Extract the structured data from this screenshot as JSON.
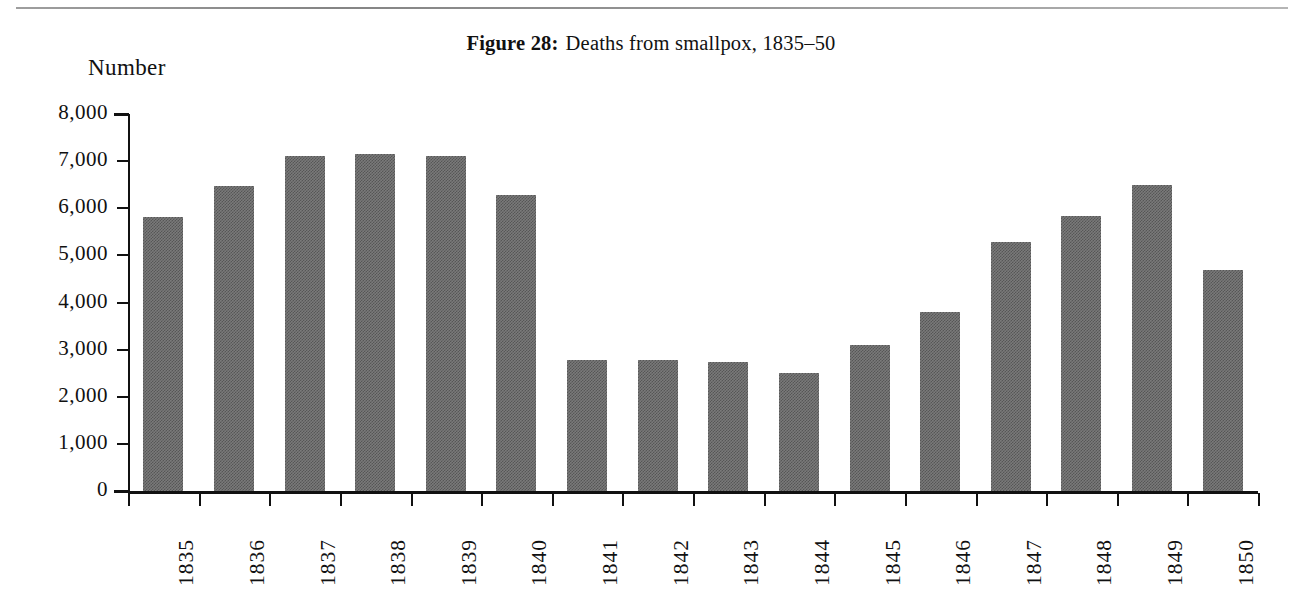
{
  "page": {
    "rule_present": true
  },
  "title": {
    "figure_label": "Figure 28:",
    "caption": "Deaths from smallpox, 1835–50"
  },
  "axes": {
    "y_axis_title": "Number",
    "y_tick_labels": [
      "8,000",
      "7,000",
      "6,000",
      "5,000",
      "4,000",
      "3,000",
      "2,000",
      "1,000",
      "0"
    ]
  },
  "colors": {
    "bar_fill": "#7a7a7a",
    "bar_dither": "#565656",
    "axis": "#111111",
    "background": "#ffffff"
  },
  "chart_data": {
    "type": "bar",
    "xlabel": "",
    "ylabel": "Number",
    "ylim": [
      0,
      8000
    ],
    "ytick_values": [
      0,
      1000,
      2000,
      3000,
      4000,
      5000,
      6000,
      7000,
      8000
    ],
    "ytick_labels": [
      "0",
      "1,000",
      "2,000",
      "3,000",
      "4,000",
      "5,000",
      "6,000",
      "7,000",
      "8,000"
    ],
    "grid": false,
    "legend": null,
    "categories": [
      "1835",
      "1836",
      "1837",
      "1838",
      "1839",
      "1840",
      "1841",
      "1842",
      "1843",
      "1844",
      "1845",
      "1846",
      "1847",
      "1848",
      "1849",
      "1850"
    ],
    "values": [
      5820,
      6480,
      7100,
      7150,
      7110,
      6280,
      2780,
      2780,
      2730,
      2510,
      3100,
      3790,
      5280,
      5830,
      6490,
      4700
    ]
  }
}
